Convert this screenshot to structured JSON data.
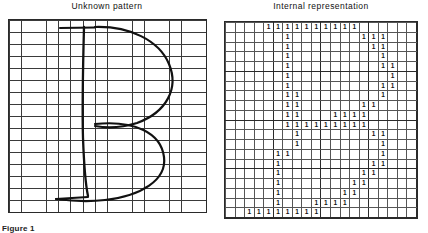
{
  "figure": {
    "caption": "Figure 1",
    "panels": [
      {
        "id": "unknown-pattern",
        "title": "Unknown pattern"
      },
      {
        "id": "internal-representation",
        "title": "Internal representation"
      }
    ]
  },
  "left_panel": {
    "title": "Unknown pattern",
    "grid": {
      "columns": 16,
      "rows": 16
    },
    "drawn_glyph": "B"
  },
  "right_panel": {
    "title": "Internal representation",
    "grid": {
      "columns": 20,
      "rows": 20
    },
    "mark": "1",
    "matrix": [
      [
        0,
        0,
        0,
        0,
        1,
        1,
        1,
        1,
        1,
        1,
        1,
        1,
        1,
        1,
        0,
        0,
        0,
        0,
        0,
        0
      ],
      [
        0,
        0,
        0,
        0,
        0,
        0,
        1,
        0,
        0,
        0,
        0,
        0,
        0,
        0,
        1,
        1,
        1,
        0,
        0,
        0
      ],
      [
        0,
        0,
        0,
        0,
        0,
        0,
        1,
        0,
        0,
        0,
        0,
        0,
        0,
        0,
        0,
        1,
        1,
        0,
        0,
        0
      ],
      [
        0,
        0,
        0,
        0,
        0,
        0,
        1,
        0,
        0,
        0,
        0,
        0,
        0,
        0,
        0,
        0,
        1,
        0,
        0,
        0
      ],
      [
        0,
        0,
        0,
        0,
        0,
        0,
        1,
        0,
        0,
        0,
        0,
        0,
        0,
        0,
        0,
        0,
        1,
        1,
        0,
        0
      ],
      [
        0,
        0,
        0,
        0,
        0,
        0,
        1,
        0,
        0,
        0,
        0,
        0,
        0,
        0,
        0,
        0,
        0,
        1,
        0,
        0
      ],
      [
        0,
        0,
        0,
        0,
        0,
        0,
        1,
        0,
        0,
        0,
        0,
        0,
        0,
        0,
        0,
        0,
        1,
        1,
        0,
        0
      ],
      [
        0,
        0,
        0,
        0,
        0,
        0,
        1,
        1,
        0,
        0,
        0,
        0,
        0,
        0,
        0,
        0,
        1,
        0,
        0,
        0
      ],
      [
        0,
        0,
        0,
        0,
        0,
        0,
        1,
        1,
        0,
        0,
        0,
        0,
        0,
        0,
        1,
        1,
        0,
        0,
        0,
        0
      ],
      [
        0,
        0,
        0,
        0,
        0,
        0,
        1,
        1,
        0,
        0,
        0,
        1,
        1,
        1,
        1,
        0,
        0,
        0,
        0,
        0
      ],
      [
        0,
        0,
        0,
        0,
        0,
        0,
        1,
        1,
        1,
        1,
        1,
        1,
        1,
        1,
        1,
        0,
        0,
        0,
        0,
        0
      ],
      [
        0,
        0,
        0,
        0,
        0,
        0,
        0,
        1,
        0,
        0,
        0,
        0,
        0,
        0,
        0,
        1,
        1,
        0,
        0,
        0
      ],
      [
        0,
        0,
        0,
        0,
        0,
        0,
        0,
        1,
        0,
        0,
        0,
        0,
        0,
        0,
        0,
        0,
        1,
        0,
        0,
        0
      ],
      [
        0,
        0,
        0,
        0,
        0,
        1,
        1,
        0,
        0,
        0,
        0,
        0,
        0,
        0,
        0,
        0,
        1,
        0,
        0,
        0
      ],
      [
        0,
        0,
        0,
        0,
        0,
        1,
        0,
        0,
        0,
        0,
        0,
        0,
        0,
        0,
        0,
        1,
        1,
        0,
        0,
        0
      ],
      [
        0,
        0,
        0,
        0,
        0,
        1,
        0,
        0,
        0,
        0,
        0,
        0,
        0,
        0,
        1,
        1,
        0,
        0,
        0,
        0
      ],
      [
        0,
        0,
        0,
        0,
        0,
        1,
        0,
        0,
        0,
        0,
        0,
        0,
        0,
        1,
        1,
        0,
        0,
        0,
        0,
        0
      ],
      [
        0,
        0,
        0,
        0,
        0,
        1,
        0,
        0,
        0,
        0,
        0,
        0,
        1,
        1,
        0,
        0,
        0,
        0,
        0,
        0
      ],
      [
        0,
        0,
        0,
        0,
        0,
        1,
        0,
        0,
        0,
        1,
        1,
        1,
        1,
        0,
        0,
        0,
        0,
        0,
        0,
        0
      ],
      [
        0,
        0,
        1,
        1,
        1,
        1,
        1,
        1,
        1,
        1,
        0,
        0,
        0,
        0,
        0,
        0,
        0,
        0,
        0,
        0
      ]
    ]
  }
}
